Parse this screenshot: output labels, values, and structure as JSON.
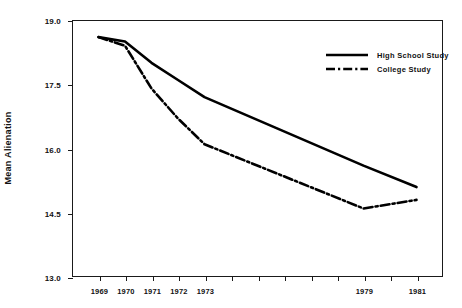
{
  "chart_data": {
    "type": "line",
    "title": "",
    "xlabel": "",
    "ylabel": "Mean Alienation",
    "xlim": [
      1968,
      1982
    ],
    "ylim": [
      13.0,
      19.0
    ],
    "grid": false,
    "legend_position": "top-right",
    "y_ticks": [
      19.0,
      17.5,
      16.0,
      14.5,
      13.0
    ],
    "y_tick_labels": [
      "19.0",
      "17.5",
      "16.0",
      "14.5",
      "13.0"
    ],
    "x_ticks": [
      1968,
      1969,
      1970,
      1971,
      1972,
      1973,
      1974,
      1975,
      1976,
      1977,
      1978,
      1979,
      1980,
      1981,
      1982
    ],
    "x_tick_labels": [
      "",
      "1969",
      "1970",
      "1971",
      "1972",
      "1973",
      "",
      "",
      "",
      "",
      "",
      "1979",
      "",
      "1981",
      ""
    ],
    "x": [
      1969,
      1970,
      1971,
      1972,
      1973,
      1979,
      1981
    ],
    "series": [
      {
        "name": "High School Study",
        "style": "solid",
        "color": "#000000",
        "values": [
          18.6,
          18.5,
          18.0,
          17.6,
          17.2,
          15.6,
          15.1
        ]
      },
      {
        "name": "College Study",
        "style": "dash-dot",
        "color": "#000000",
        "values": [
          18.6,
          18.4,
          17.4,
          16.7,
          16.1,
          14.6,
          14.8
        ]
      }
    ]
  },
  "legend": {
    "items": [
      {
        "label": "High School Study",
        "style": "solid"
      },
      {
        "label": "College Study",
        "style": "dash-dot"
      }
    ]
  },
  "axes": {
    "y_title": "Mean Alienation"
  }
}
